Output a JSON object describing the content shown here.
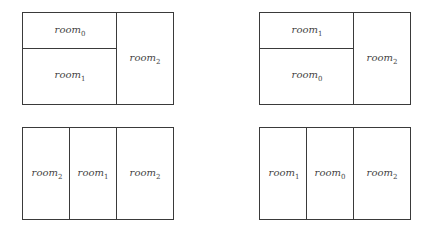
{
  "panels": [
    {
      "name": "top-left",
      "rooms": [
        {
          "base": "room",
          "sub": "0"
        },
        {
          "base": "room",
          "sub": "1"
        },
        {
          "base": "room",
          "sub": "2"
        }
      ]
    },
    {
      "name": "top-right",
      "rooms": [
        {
          "base": "room",
          "sub": "1"
        },
        {
          "base": "room",
          "sub": "0"
        },
        {
          "base": "room",
          "sub": "2"
        }
      ]
    },
    {
      "name": "bottom-left",
      "rooms": [
        {
          "base": "room",
          "sub": "2"
        },
        {
          "base": "room",
          "sub": "1"
        },
        {
          "base": "room",
          "sub": "2"
        }
      ]
    },
    {
      "name": "bottom-right",
      "rooms": [
        {
          "base": "room",
          "sub": "1"
        },
        {
          "base": "room",
          "sub": "0"
        },
        {
          "base": "room",
          "sub": "2"
        }
      ]
    }
  ],
  "colors": {
    "line": "#3a3a3a",
    "text": "#444444",
    "background": "#ffffff"
  }
}
